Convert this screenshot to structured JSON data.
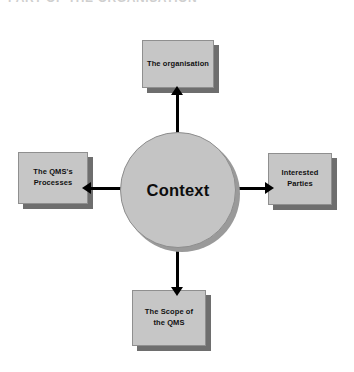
{
  "heading": {
    "text": "PART OF THE ORGANISATION"
  },
  "diagram": {
    "center": {
      "label": "Context"
    },
    "nodes": [
      {
        "id": "organisation",
        "label": "The organisation",
        "position": "top",
        "arrow_direction": "up"
      },
      {
        "id": "processes",
        "label": "The QMS's\nProcesses",
        "line1": "The QMS's",
        "line2": "Processes",
        "position": "left",
        "arrow_direction": "left"
      },
      {
        "id": "interested-parties",
        "label": "Interested\nParties",
        "line1": "Interested",
        "line2": "Parties",
        "position": "right",
        "arrow_direction": "right"
      },
      {
        "id": "scope",
        "label": "The Scope of\nthe QMS",
        "line1": "The Scope of",
        "line2": "the QMS",
        "position": "bottom",
        "arrow_direction": "down"
      }
    ],
    "colors": {
      "box_fill": "#c6c6c6",
      "box_shadow": "#6e6e6e",
      "box_border": "#8f8f8f",
      "circle_fill": "#c4c4c4",
      "circle_shadow": "#9a9a9a",
      "connector": "#000000",
      "background": "#ffffff",
      "text": "#111111"
    }
  }
}
